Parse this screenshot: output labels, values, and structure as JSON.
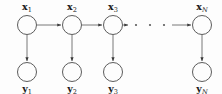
{
  "diagram": {
    "background_color": "#fdfdfd",
    "stroke_color": "#4a4a4a",
    "edge_color": "#6a6a6a",
    "label_color": "#1a1a1a",
    "latent_nodes": [
      {
        "id": "x1",
        "base": "x",
        "subscript": "1",
        "subscript_italic": false,
        "cx": 27,
        "cy": 25,
        "r": 9.5,
        "label_x": 27,
        "label_y": 10
      },
      {
        "id": "x2",
        "base": "x",
        "subscript": "2",
        "subscript_italic": false,
        "cx": 72,
        "cy": 25,
        "r": 9.5,
        "label_x": 72,
        "label_y": 10
      },
      {
        "id": "x3",
        "base": "x",
        "subscript": "3",
        "subscript_italic": false,
        "cx": 113,
        "cy": 25,
        "r": 9.5,
        "label_x": 113,
        "label_y": 10
      },
      {
        "id": "xN",
        "base": "x",
        "subscript": "N",
        "subscript_italic": true,
        "cx": 202,
        "cy": 25,
        "r": 9.5,
        "label_x": 202,
        "label_y": 10
      }
    ],
    "observed_nodes": [
      {
        "id": "y1",
        "base": "y",
        "subscript": "1",
        "subscript_italic": false,
        "cx": 27,
        "cy": 72,
        "r": 9.5,
        "label_x": 27,
        "label_y": 92
      },
      {
        "id": "y2",
        "base": "y",
        "subscript": "2",
        "subscript_italic": false,
        "cx": 72,
        "cy": 72,
        "r": 9.5,
        "label_x": 72,
        "label_y": 92
      },
      {
        "id": "y3",
        "base": "y",
        "subscript": "3",
        "subscript_italic": false,
        "cx": 113,
        "cy": 72,
        "r": 9.5,
        "label_x": 113,
        "label_y": 92
      },
      {
        "id": "yN",
        "base": "y",
        "subscript": "N",
        "subscript_italic": true,
        "cx": 202,
        "cy": 72,
        "r": 9.5,
        "label_x": 202,
        "label_y": 92
      }
    ],
    "horizontal_edges": [
      {
        "id": "x1-to-x2",
        "x1": 37,
        "x2": 61,
        "y": 25
      },
      {
        "id": "x2-to-x3",
        "x1": 82,
        "x2": 102,
        "y": 25
      },
      {
        "id": "x3-to-dots",
        "x1": 123,
        "x2": 128,
        "y": 25
      },
      {
        "id": "dots-to-xN",
        "x1": 172,
        "x2": 191,
        "y": 25
      }
    ],
    "vertical_edges": [
      {
        "id": "x1-to-y1",
        "x": 27,
        "y1": 35,
        "y2": 61
      },
      {
        "id": "x2-to-y2",
        "x": 72,
        "y1": 35,
        "y2": 61
      },
      {
        "id": "x3-to-y3",
        "x": 113,
        "y1": 35,
        "y2": 61
      },
      {
        "id": "xN-to-yN",
        "x": 202,
        "y1": 35,
        "y2": 61
      }
    ],
    "ellipsis_dots": [
      {
        "id": "dot-1",
        "cx": 136,
        "cy": 25,
        "r": 1.1
      },
      {
        "id": "dot-2",
        "cx": 150,
        "cy": 25,
        "r": 1.1
      },
      {
        "id": "dot-3",
        "cx": 164,
        "cy": 25,
        "r": 1.1
      }
    ]
  }
}
